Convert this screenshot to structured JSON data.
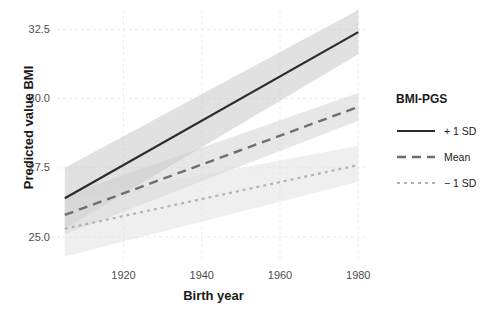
{
  "chart_data": {
    "type": "line",
    "title": "",
    "xlabel": "Birth year",
    "ylabel": "Predicted value BMI",
    "xlim": [
      1903,
      1983
    ],
    "ylim": [
      24.1,
      33.2
    ],
    "xticks": [
      1920,
      1940,
      1960,
      1980
    ],
    "xticklabels": [
      "1920",
      "1940",
      "1960",
      "1980"
    ],
    "yticks": [
      25.0,
      27.5,
      30.0,
      32.5
    ],
    "yticklabels": [
      "25.0",
      "27.5",
      "30.0",
      "32.5"
    ],
    "grid": true,
    "grid_color": "#ebebeb",
    "panel_background": "#ffffff",
    "legend": {
      "title": "BMI-PGS",
      "position": "right",
      "entries": [
        {
          "label": "+ 1 SD",
          "linestyle": "solid",
          "color": "#2b2b2b"
        },
        {
          "label": "Mean",
          "linestyle": "dashed",
          "color": "#6e6e6e"
        },
        {
          "label": "− 1 SD",
          "linestyle": "dotted",
          "color": "#b3b3b3"
        }
      ]
    },
    "x": [
      1905,
      1980
    ],
    "series": [
      {
        "name": "+ 1 SD",
        "linestyle": "solid",
        "color": "#2b2b2b",
        "values": [
          26.4,
          32.4
        ],
        "ci_lower": [
          25.3,
          31.6
        ],
        "ci_upper": [
          27.5,
          33.2
        ],
        "ribbon_color": "#bdbdbd",
        "ribbon_opacity": 0.45
      },
      {
        "name": "Mean",
        "linestyle": "dashed",
        "color": "#6e6e6e",
        "values": [
          25.8,
          29.7
        ],
        "ci_lower": [
          25.1,
          29.2
        ],
        "ci_upper": [
          26.5,
          30.2
        ],
        "ribbon_color": "#c9c9c9",
        "ribbon_opacity": 0.45
      },
      {
        "name": "− 1 SD",
        "linestyle": "dotted",
        "color": "#b3b3b3",
        "values": [
          25.3,
          27.6
        ],
        "ci_lower": [
          24.3,
          27.0
        ],
        "ci_upper": [
          26.3,
          28.3
        ],
        "ribbon_color": "#dcdcdc",
        "ribbon_opacity": 0.45
      }
    ]
  }
}
